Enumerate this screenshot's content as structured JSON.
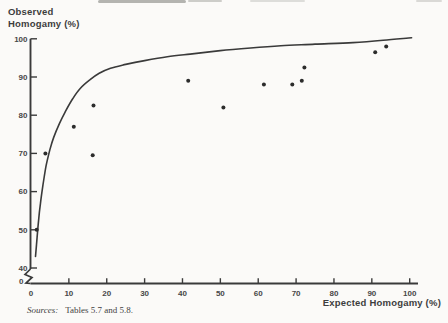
{
  "figure": {
    "background": "#fbfaf8",
    "ink": "#3a3a3a"
  },
  "chart_data": {
    "type": "scatter",
    "title": "",
    "xlabel": "Expected Homogamy (%)",
    "ylabel": "Observed Homogamy (%)",
    "ylabel_lines": [
      "Observed",
      "Homogamy (%)"
    ],
    "xlim": [
      0,
      100
    ],
    "ylim": [
      0,
      100
    ],
    "y_axis_break": [
      0,
      40
    ],
    "grid": false,
    "x_ticks": [
      0,
      10,
      20,
      30,
      40,
      50,
      60,
      70,
      80,
      90,
      100
    ],
    "y_ticks": [
      0,
      40,
      50,
      60,
      70,
      80,
      90,
      100
    ],
    "points": [
      [
        1.5,
        50
      ],
      [
        3.8,
        70
      ],
      [
        11.3,
        77
      ],
      [
        16.3,
        69.5
      ],
      [
        16.5,
        82.5
      ],
      [
        41.5,
        89
      ],
      [
        50.8,
        82
      ],
      [
        61.5,
        88
      ],
      [
        69,
        88
      ],
      [
        71.5,
        89
      ],
      [
        72.2,
        92.5
      ],
      [
        90.9,
        96.5
      ],
      [
        93.8,
        98
      ]
    ],
    "curve": {
      "name": "fitted-curve",
      "points": [
        [
          1.2,
          43
        ],
        [
          1.6,
          48
        ],
        [
          2.0,
          52.5
        ],
        [
          2.5,
          57
        ],
        [
          3.2,
          62
        ],
        [
          4.0,
          66.8
        ],
        [
          5.0,
          71
        ],
        [
          6.0,
          74.2
        ],
        [
          7.5,
          77.8
        ],
        [
          9.0,
          80.8
        ],
        [
          11.0,
          84.3
        ],
        [
          13.0,
          87
        ],
        [
          15.6,
          89.3
        ],
        [
          18.0,
          91
        ],
        [
          21.0,
          92.3
        ],
        [
          25.0,
          93.3
        ],
        [
          30.0,
          94.3
        ],
        [
          36.0,
          95.3
        ],
        [
          42.0,
          96
        ],
        [
          50.0,
          96.9
        ],
        [
          58.0,
          97.6
        ],
        [
          66.0,
          98.2
        ],
        [
          75.0,
          98.6
        ],
        [
          85.0,
          99
        ],
        [
          93.0,
          99.6
        ],
        [
          100.5,
          100.3
        ]
      ]
    }
  },
  "sources": {
    "label": "Sources:",
    "text": "Tables 5.7 and 5.8."
  }
}
